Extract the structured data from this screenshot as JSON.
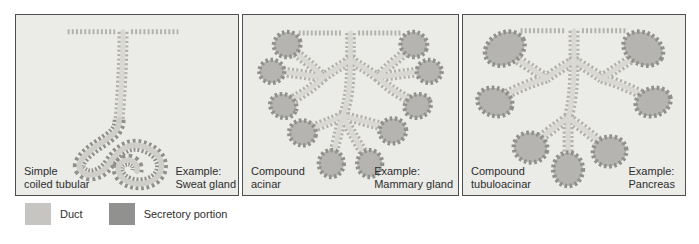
{
  "panels": [
    {
      "label_line1": "Simple",
      "label_line2": "coiled tubular",
      "example_heading": "Example:",
      "example_name": "Sweat gland"
    },
    {
      "label_line1": "Compound",
      "label_line2": "acinar",
      "example_heading": "Example:",
      "example_name": "Mammary gland"
    },
    {
      "label_line1": "Compound",
      "label_line2": "tubuloacinar",
      "example_heading": "Example:",
      "example_name": "Pancreas"
    }
  ],
  "legend": {
    "items": [
      {
        "label": "Duct",
        "color": "#c6c5c1"
      },
      {
        "label": "Secretory portion",
        "color": "#919190"
      }
    ]
  },
  "colors": {
    "panel_background": "#ebebe8",
    "panel_border": "#4f4f4f",
    "duct_cells": "#b2b1ac",
    "duct_lumen": "#d9d8d2",
    "secretory_cells": "#8f8f8c",
    "acinus_fill": "#b5b4b0",
    "text": "#2e2e2e"
  }
}
